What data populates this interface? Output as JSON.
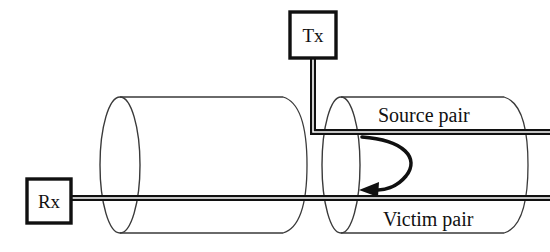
{
  "diagram": {
    "type": "cable-crosstalk-schematic",
    "background_color": "#ffffff",
    "line_color": "#101010",
    "cylinder_color": "#3a3a3a",
    "nodes": [
      {
        "id": "tx",
        "label": "Tx",
        "role": "transmitter",
        "shape": "square",
        "x": 290,
        "y": 12,
        "width": 46,
        "height": 46
      },
      {
        "id": "rx",
        "label": "Rx",
        "role": "receiver",
        "shape": "square",
        "x": 27,
        "y": 179,
        "width": 44,
        "height": 44
      }
    ],
    "pairs": [
      {
        "id": "source-pair",
        "label": "Source pair",
        "label_x": 378,
        "label_y": 122,
        "line_y": 132,
        "connected_to": "tx"
      },
      {
        "id": "victim-pair",
        "label": "Victim pair",
        "label_x": 383,
        "label_y": 226,
        "line_y": 198,
        "connected_to": "rx"
      }
    ],
    "cylinders": [
      {
        "id": "left-cable-bundle",
        "cx_near": 120,
        "cx_far": 287,
        "cy": 165,
        "rx": 20,
        "ry": 68
      },
      {
        "id": "right-cable-bundle",
        "cx_near": 341,
        "cx_far": 508,
        "cy": 165,
        "rx": 19,
        "ry": 68
      }
    ],
    "coupling": {
      "id": "crosstalk-arrow",
      "description": "curved arrow from source pair to victim pair",
      "direction": "source-to-victim",
      "from_x": 362,
      "from_y": 137,
      "to_x": 366,
      "to_y": 190
    }
  }
}
